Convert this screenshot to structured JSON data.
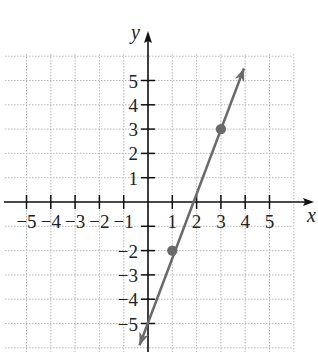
{
  "chart_data": {
    "type": "line",
    "title": "",
    "xlabel": "x",
    "ylabel": "y",
    "xlim": [
      -6,
      6
    ],
    "ylim": [
      -6,
      6
    ],
    "grid": true,
    "x_ticks": [
      -5,
      -4,
      -3,
      -2,
      -1,
      1,
      2,
      3,
      4,
      5
    ],
    "y_ticks": [
      -5,
      -4,
      -3,
      -2,
      1,
      2,
      3,
      4,
      5
    ],
    "x_tick_labels": [
      "−5",
      "−4",
      "−3",
      "−2",
      "−1",
      "1",
      "2",
      "3",
      "4",
      "5"
    ],
    "y_tick_labels": [
      "−5",
      "−4",
      "−3",
      "−2",
      "1",
      "2",
      "3",
      "4",
      "5"
    ],
    "series": [
      {
        "name": "line",
        "slope": 2.5,
        "intercept": -4.5,
        "line_endpoints": [
          [
            -0.35,
            -5.9
          ],
          [
            3.95,
            5.5
          ]
        ],
        "points": [
          [
            1,
            -2
          ],
          [
            3,
            3
          ]
        ],
        "arrows_both_ends": true,
        "color": "#666666"
      }
    ],
    "legend": null
  },
  "colors": {
    "axis": "#111111",
    "grid": "#b8b8b8",
    "line": "#6a6a6a",
    "point": "#6a6a6a"
  }
}
